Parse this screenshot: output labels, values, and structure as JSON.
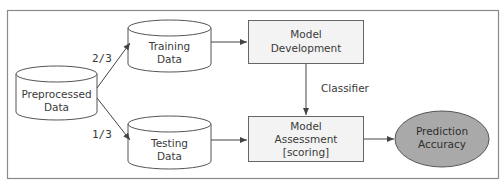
{
  "diagram": {
    "nodes": {
      "preprocessed": {
        "line1": "Preprocessed",
        "line2": "Data",
        "shape": "cylinder"
      },
      "training": {
        "line1": "Training",
        "line2": "Data",
        "shape": "cylinder"
      },
      "testing": {
        "line1": "Testing",
        "line2": "Data",
        "shape": "cylinder"
      },
      "development": {
        "line1": "Model",
        "line2": "Development",
        "shape": "rectangle"
      },
      "assessment": {
        "line1": "Model",
        "line2": "Assessment",
        "line3": "[scoring]",
        "shape": "rectangle"
      },
      "accuracy": {
        "line1": "Prediction",
        "line2": "Accuracy",
        "shape": "ellipse"
      }
    },
    "edges": {
      "to_training": {
        "label": "2/3"
      },
      "to_testing": {
        "label": "1/3"
      },
      "dev_to_assessment": {
        "label": "Classifier"
      }
    },
    "colors": {
      "frame": "#8a8a8a",
      "stroke": "#555555",
      "box_fill": "#f3f3f3",
      "ellipse_fill": "#a9a9a9",
      "text": "#3a3a3a"
    }
  }
}
